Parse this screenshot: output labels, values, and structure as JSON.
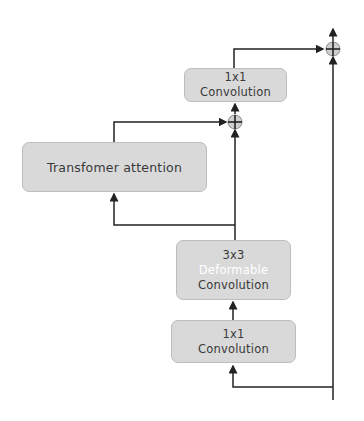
{
  "diagram": {
    "nodes": {
      "conv1x1_top": {
        "line1": "1x1",
        "line2": "Convolution"
      },
      "transformer": {
        "label": "Transfomer attention"
      },
      "deform": {
        "line1": "3x3",
        "line2": "Deformable",
        "line3": "Convolution"
      },
      "conv1x1_bottom": {
        "line1": "1x1",
        "line2": "Convolution"
      }
    },
    "adders": [
      "sum-top",
      "sum-middle"
    ],
    "colors": {
      "box_fill": "#d9d9d9",
      "box_border": "#bdbdbd",
      "line": "#222222",
      "text": "#3a3a3a",
      "highlight_text": "#ffffff"
    }
  }
}
